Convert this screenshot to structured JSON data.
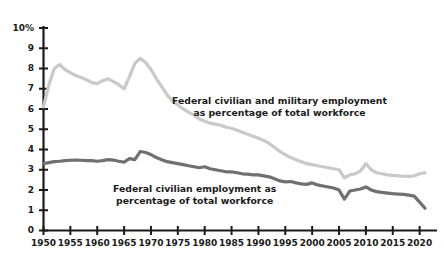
{
  "chart_data": {
    "type": "line",
    "title": "",
    "xlabel": "",
    "ylabel": "",
    "xlim": [
      1950,
      2021
    ],
    "ylim": [
      0,
      10
    ],
    "grid": false,
    "legend_position": "inline-annotations",
    "xticks": [
      "1950",
      "1955",
      "1960",
      "1965",
      "1970",
      "1975",
      "1980",
      "1985",
      "1990",
      "1995",
      "2000",
      "2005",
      "2010",
      "2015",
      "2020"
    ],
    "yticks": [
      "0",
      "1",
      "2",
      "3",
      "4",
      "5",
      "6",
      "7",
      "8",
      "9",
      "10%"
    ],
    "annotations": [
      "Federal civilian and military employment as percentage of total workforce",
      "Federal civilian employment as percentage of total workforce"
    ],
    "x": [
      1950,
      1951,
      1952,
      1953,
      1954,
      1955,
      1956,
      1957,
      1958,
      1959,
      1960,
      1961,
      1962,
      1963,
      1964,
      1965,
      1966,
      1967,
      1968,
      1969,
      1970,
      1971,
      1972,
      1973,
      1974,
      1975,
      1976,
      1977,
      1978,
      1979,
      1980,
      1981,
      1982,
      1983,
      1984,
      1985,
      1986,
      1987,
      1988,
      1989,
      1990,
      1991,
      1992,
      1993,
      1994,
      1995,
      1996,
      1997,
      1998,
      1999,
      2000,
      2001,
      2002,
      2003,
      2004,
      2005,
      2006,
      2007,
      2008,
      2009,
      2010,
      2011,
      2012,
      2013,
      2014,
      2015,
      2016,
      2017,
      2018,
      2019,
      2020,
      2021
    ],
    "series": [
      {
        "name": "Federal civilian and military employment as percentage of total workforce",
        "color": "#c9c9c9",
        "values": [
          6.1,
          7.2,
          8.0,
          8.2,
          7.95,
          7.8,
          7.65,
          7.55,
          7.45,
          7.3,
          7.25,
          7.4,
          7.5,
          7.35,
          7.2,
          7.0,
          7.6,
          8.25,
          8.5,
          8.3,
          7.95,
          7.5,
          7.1,
          6.7,
          6.4,
          6.2,
          6.0,
          5.85,
          5.7,
          5.5,
          5.4,
          5.3,
          5.25,
          5.2,
          5.1,
          5.05,
          4.95,
          4.85,
          4.75,
          4.65,
          4.55,
          4.45,
          4.3,
          4.1,
          3.9,
          3.75,
          3.6,
          3.5,
          3.4,
          3.3,
          3.25,
          3.2,
          3.15,
          3.1,
          3.05,
          3.0,
          2.6,
          2.75,
          2.8,
          2.95,
          3.3,
          3.0,
          2.85,
          2.8,
          2.75,
          2.72,
          2.7,
          2.68,
          2.67,
          2.7,
          2.8,
          2.85
        ]
      },
      {
        "name": "Federal civilian employment as percentage of total workforce",
        "color": "#707070",
        "values": [
          3.3,
          3.35,
          3.4,
          3.42,
          3.45,
          3.47,
          3.48,
          3.47,
          3.45,
          3.45,
          3.42,
          3.45,
          3.5,
          3.48,
          3.42,
          3.38,
          3.55,
          3.5,
          3.9,
          3.85,
          3.75,
          3.6,
          3.5,
          3.4,
          3.35,
          3.3,
          3.25,
          3.2,
          3.15,
          3.1,
          3.15,
          3.05,
          3.0,
          2.95,
          2.9,
          2.9,
          2.85,
          2.8,
          2.78,
          2.75,
          2.75,
          2.7,
          2.65,
          2.55,
          2.45,
          2.4,
          2.42,
          2.35,
          2.3,
          2.28,
          2.35,
          2.25,
          2.2,
          2.15,
          2.1,
          2.0,
          1.55,
          1.95,
          2.0,
          2.05,
          2.15,
          2.0,
          1.92,
          1.88,
          1.85,
          1.82,
          1.8,
          1.78,
          1.75,
          1.7,
          1.4,
          1.1
        ]
      }
    ]
  }
}
